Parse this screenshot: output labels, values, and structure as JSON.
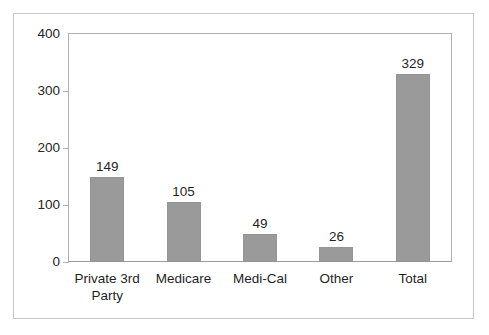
{
  "chart_data": {
    "type": "bar",
    "title": "",
    "subtitle": "",
    "xlabel": "",
    "ylabel": "",
    "categories": [
      "Private 3rd Party",
      "Medicare",
      "Medi-Cal",
      "Other",
      "Total"
    ],
    "category_lines": [
      [
        "Private 3rd",
        "Party"
      ],
      [
        "Medicare"
      ],
      [
        "Medi-Cal"
      ],
      [
        "Other"
      ],
      [
        "Total"
      ]
    ],
    "values": [
      149,
      105,
      49,
      26,
      329
    ],
    "value_labels": [
      "149",
      "105",
      "49",
      "26",
      "329"
    ],
    "ylim": [
      0,
      400
    ],
    "yticks": [
      0,
      100,
      200,
      300,
      400
    ],
    "ytick_labels": [
      "0",
      "100",
      "200",
      "300",
      "400"
    ],
    "grid": false,
    "legend": null,
    "legend_position": "none",
    "series": [
      {
        "name": "Count",
        "values": [
          149,
          105,
          49,
          26,
          329
        ]
      }
    ],
    "colors": {
      "bar_fill": "#9a9a9a",
      "bar_border": "#949494",
      "axis_line": "#b0b0b0",
      "baseline": "#9a9a9a",
      "frame": "#c8c8c8",
      "text": "#1f1f1f",
      "background": "#ffffff"
    }
  }
}
